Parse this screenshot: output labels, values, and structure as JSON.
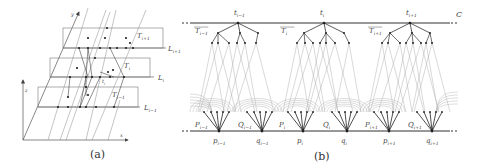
{
  "figure": {
    "panel_a": {
      "caption": "(a)",
      "axes": {
        "x": "x",
        "y": "y",
        "z": "z"
      },
      "layers": [
        {
          "region": "T",
          "region_sub": "i+1",
          "line": "L",
          "line_sub": "i+1"
        },
        {
          "region": "T",
          "region_sub": "i",
          "line": "L",
          "line_sub": "i"
        },
        {
          "region": "T",
          "region_sub": "i−1",
          "line": "L",
          "line_sub": "i−1"
        }
      ],
      "inner_point": {
        "name": "t",
        "sub": "i"
      }
    },
    "panel_b": {
      "caption": "(b)",
      "curve_label": "C",
      "top_points": [
        {
          "name": "t",
          "sub": "i−1",
          "tree": "T",
          "tree_sub": "i−1"
        },
        {
          "name": "t",
          "sub": "i",
          "tree": "T",
          "tree_sub": "i"
        },
        {
          "name": "t",
          "sub": "i+1",
          "tree": "T",
          "tree_sub": "i+1"
        }
      ],
      "bottom_points": [
        {
          "name": "p",
          "sub": "i−1",
          "set": "P",
          "set_sub": "i−1"
        },
        {
          "name": "q",
          "sub": "i−1",
          "set": "Q",
          "set_sub": "i−1"
        },
        {
          "name": "p",
          "sub": "i",
          "set": "P",
          "set_sub": "i"
        },
        {
          "name": "q",
          "sub": "i",
          "set": "Q",
          "set_sub": "i"
        },
        {
          "name": "p",
          "sub": "i+1",
          "set": "P",
          "set_sub": "i+1"
        },
        {
          "name": "q",
          "sub": "i+1",
          "set": "Q",
          "set_sub": "i+1"
        }
      ]
    }
  }
}
